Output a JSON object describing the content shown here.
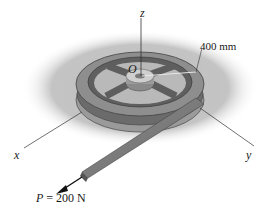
{
  "diagram": {
    "type": "engineering-mechanics-figure",
    "labels": {
      "z_axis": "z",
      "x_axis": "x",
      "y_axis": "y",
      "origin": "O",
      "radius": "400 mm",
      "force_symbol": "P",
      "force_value": "= 200 N"
    },
    "colors": {
      "background": "#ffffff",
      "ground_shade": "#b8b8b8",
      "wheel_rim": "#8a8a8a",
      "wheel_dark": "#5e5e5e",
      "belt": "#7a7a7a",
      "axis_line": "#333333"
    }
  }
}
